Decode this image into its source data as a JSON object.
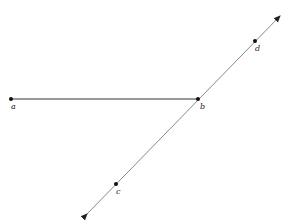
{
  "diagram": {
    "points": [
      {
        "id": "a",
        "label": "a",
        "x": 11,
        "y": 99
      },
      {
        "id": "b",
        "label": "b",
        "x": 198,
        "y": 99
      },
      {
        "id": "c",
        "label": "c",
        "x": 116,
        "y": 184
      },
      {
        "id": "d",
        "label": "d",
        "x": 255,
        "y": 41
      }
    ],
    "segments": [
      {
        "from": "a",
        "to": "b",
        "type": "segment"
      }
    ],
    "lines": [
      {
        "through": [
          "c",
          "d"
        ],
        "type": "line",
        "arrows": "both"
      }
    ]
  }
}
